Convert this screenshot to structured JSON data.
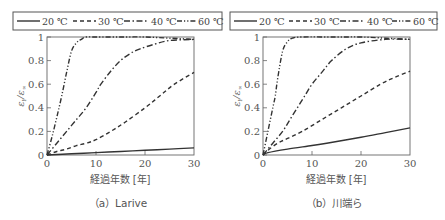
{
  "chart_data": [
    {
      "type": "line",
      "title": "(a) Larive",
      "caption": "（a）Larive",
      "xlabel": "経過年数 [年]",
      "ylabel": "ε_t / ε_∞",
      "xlim": [
        0,
        30
      ],
      "ylim": [
        0,
        1
      ],
      "xticks": [
        "0",
        "10",
        "20",
        "30"
      ],
      "yticks": [
        "0",
        "0.2",
        "0.4",
        "0.6",
        "0.8",
        "1"
      ],
      "grid": false,
      "legend_position": "top, boxed",
      "legend": [
        "20 ℃",
        "30 ℃",
        "40 ℃",
        "60 ℃"
      ],
      "series": [
        {
          "name": "20 ℃",
          "style": "solid",
          "x": [
            0,
            5,
            10,
            15,
            20,
            25,
            30
          ],
          "y": [
            0,
            0.01,
            0.02,
            0.03,
            0.04,
            0.05,
            0.06
          ]
        },
        {
          "name": "30 ℃",
          "style": "dashed",
          "x": [
            0,
            2,
            4,
            6,
            8,
            10,
            13,
            16,
            20,
            23,
            26,
            30
          ],
          "y": [
            0,
            0.03,
            0.05,
            0.08,
            0.1,
            0.13,
            0.2,
            0.28,
            0.4,
            0.5,
            0.6,
            0.7
          ]
        },
        {
          "name": "40 ℃",
          "style": "dash-dot",
          "x": [
            0,
            2,
            4,
            6,
            8,
            10,
            11,
            13,
            15,
            17,
            19,
            22,
            25,
            30
          ],
          "y": [
            0,
            0.1,
            0.2,
            0.3,
            0.4,
            0.53,
            0.6,
            0.71,
            0.8,
            0.86,
            0.9,
            0.94,
            0.97,
            0.98
          ]
        },
        {
          "name": "60 ℃",
          "style": "dash-dot-dot",
          "x": [
            0,
            1,
            2,
            3,
            4,
            5,
            6,
            7,
            8,
            10,
            15,
            20,
            25,
            30
          ],
          "y": [
            0,
            0.15,
            0.32,
            0.5,
            0.7,
            0.88,
            0.95,
            0.98,
            1.0,
            1.0,
            1.0,
            1.0,
            0.99,
            0.98
          ]
        }
      ]
    },
    {
      "type": "line",
      "title": "(b) 川端ら",
      "caption": "（b）川端ら",
      "xlabel": "経過年数 [年]",
      "ylabel": "ε_t / ε_∞",
      "xlim": [
        0,
        30
      ],
      "ylim": [
        0,
        1
      ],
      "xticks": [
        "0",
        "10",
        "20",
        "30"
      ],
      "yticks": [
        "0",
        "0.2",
        "0.4",
        "0.6",
        "0.8",
        "1"
      ],
      "grid": false,
      "legend_position": "top, boxed",
      "legend": [
        "20 ℃",
        "30 ℃",
        "40 ℃",
        "60 ℃"
      ],
      "series": [
        {
          "name": "20 ℃",
          "style": "solid",
          "x": [
            0,
            1,
            5,
            10,
            13,
            20,
            25,
            30
          ],
          "y": [
            0,
            0.02,
            0.05,
            0.08,
            0.1,
            0.15,
            0.19,
            0.23
          ]
        },
        {
          "name": "30 ℃",
          "style": "dashed",
          "x": [
            0,
            1,
            3,
            5,
            8,
            12,
            16,
            20,
            24,
            27,
            30
          ],
          "y": [
            0,
            0.04,
            0.1,
            0.14,
            0.2,
            0.3,
            0.4,
            0.5,
            0.6,
            0.66,
            0.71
          ]
        },
        {
          "name": "40 ℃",
          "style": "dash-dot",
          "x": [
            0,
            2,
            4,
            5.5,
            7,
            8.5,
            10,
            12,
            14,
            17,
            20,
            25,
            30
          ],
          "y": [
            0,
            0.1,
            0.2,
            0.3,
            0.4,
            0.5,
            0.6,
            0.7,
            0.8,
            0.9,
            0.95,
            0.98,
            0.98
          ]
        },
        {
          "name": "60 ℃",
          "style": "dash-dot-dot",
          "x": [
            0,
            1,
            2,
            2.5,
            3,
            4,
            5,
            6,
            8,
            15,
            20,
            25,
            30
          ],
          "y": [
            0,
            0.2,
            0.4,
            0.5,
            0.65,
            0.88,
            0.96,
            0.99,
            1.0,
            1.0,
            1.0,
            0.99,
            0.98
          ]
        }
      ]
    }
  ],
  "panels": [
    {
      "legend": [
        "20 ℃",
        "30 ℃",
        "40 ℃",
        "60 ℃"
      ],
      "xticks": [
        "0",
        "10",
        "20",
        "30"
      ],
      "yticks": [
        "0",
        "0.2",
        "0.4",
        "0.6",
        "0.8",
        "1"
      ],
      "xlabel": "経過年数 [年]",
      "ylabel_main": "ε",
      "ylabel_sub_t": "t",
      "ylabel_sep": "/",
      "ylabel_sub_inf": "∞",
      "caption": "（a）Larive"
    },
    {
      "legend": [
        "20 ℃",
        "30 ℃",
        "40 ℃",
        "60 ℃"
      ],
      "xticks": [
        "0",
        "10",
        "20",
        "30"
      ],
      "yticks": [
        "0",
        "0.2",
        "0.4",
        "0.6",
        "0.8",
        "1"
      ],
      "xlabel": "経過年数 [年]",
      "ylabel_main": "ε",
      "ylabel_sub_t": "t",
      "ylabel_sep": "/",
      "ylabel_sub_inf": "∞",
      "caption": "（b）川端ら"
    }
  ],
  "colors": {
    "line": "#3a3a3a",
    "axis": "#666666",
    "text": "#555555"
  }
}
